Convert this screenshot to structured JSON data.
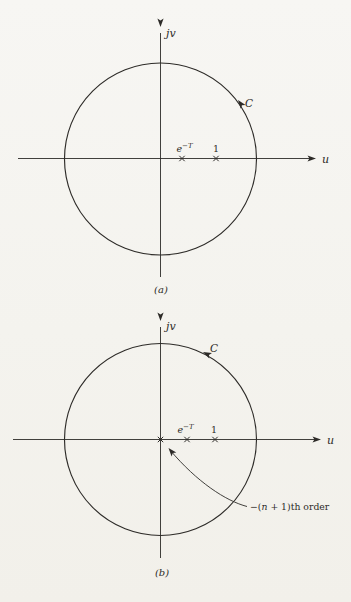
{
  "style": {
    "ink_color": "#2d2b28",
    "paper_color": "#f5f4f0"
  },
  "diagram_a": {
    "vertical_axis_label": "jv",
    "horizontal_axis_label": "u",
    "contour_label": "C",
    "contour_direction": "counterclockwise",
    "pole_e": {
      "base": "e",
      "sup": "−T",
      "symbol": "×"
    },
    "pole_1": {
      "label": "1",
      "symbol": "×"
    },
    "caption": "(a)"
  },
  "diagram_b": {
    "vertical_axis_label": "jv",
    "horizontal_axis_label": "u",
    "contour_label": "C",
    "contour_direction": "counterclockwise",
    "origin_pole": {
      "symbol": "×",
      "note_prefix": "−(",
      "note_var": "n",
      "note_suffix": " + 1)th order"
    },
    "pole_e": {
      "base": "e",
      "sup": "−T",
      "symbol": "×"
    },
    "pole_1": {
      "label": "1",
      "symbol": "×"
    },
    "caption": "(b)"
  }
}
